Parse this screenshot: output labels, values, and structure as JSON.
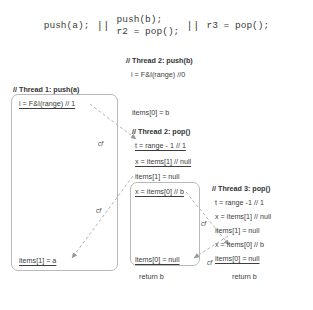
{
  "program": {
    "col1": [
      "push(a);"
    ],
    "sep": "||",
    "col2": [
      "push(b);",
      "r2 = pop();"
    ],
    "col3": [
      "r3 = pop();"
    ]
  },
  "thread1": {
    "header": "// Thread 1: push(a)",
    "first": "i = F&I(range) // 1",
    "last": "items[1] = a"
  },
  "thread2_push": {
    "header": "// Thread 2: push(b)",
    "line": "i = F&I(range) //0",
    "store": "items[0] = b"
  },
  "thread2_pop": {
    "header": "// Thread 2: pop()",
    "l1": "t = range - 1 // 1",
    "l2": "x = items[1] // null",
    "l3": "items[1] = null",
    "l4": "x = items[0] // b",
    "l5": "items[0] = null",
    "ret": "return b"
  },
  "thread3_pop": {
    "header": "// Thread 3: pop()",
    "lines": [
      "t = range -1 // 1",
      "x = items[1] // null",
      "items[1] = null",
      "x = items[0] // b",
      "items[0] = null"
    ],
    "ret": "return b"
  },
  "edges": {
    "cf1": "cf",
    "cf2": "cf",
    "cf3": "cf",
    "cf4": "cf"
  },
  "colors": {
    "text": "#3d3d3d",
    "box_border": "#b9b9b9",
    "edge": "#a8a8a8"
  }
}
